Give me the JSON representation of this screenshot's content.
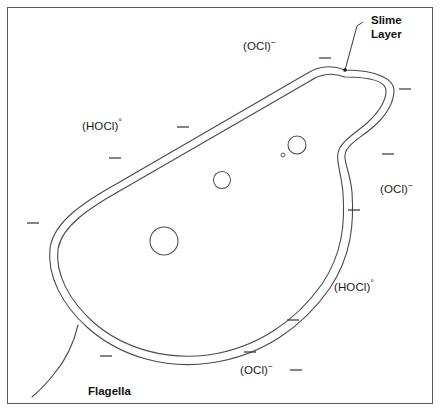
{
  "figure": {
    "background_color": "#ffffff",
    "frame_color": "#5a5a5a",
    "line_color": "#4a4a4a",
    "text_color": "#1a1a1a"
  },
  "callouts": [
    {
      "name": "slime-layer",
      "line1": "Slime",
      "line2": "Layer",
      "x": 371,
      "y": 14,
      "leader": {
        "from_x": 363,
        "from_y": 22,
        "elbow_x": 357,
        "elbow_y": 26,
        "to_x": 345,
        "to_y": 70
      }
    }
  ],
  "parts": [
    {
      "name": "flagella",
      "label": "Flagella",
      "x": 88,
      "y": 385
    }
  ],
  "species": [
    {
      "name": "ocl-top",
      "formula": "(OCl)",
      "charge": "−",
      "x": 243,
      "y": 40
    },
    {
      "name": "hocl-left",
      "formula": "(HOCl)",
      "charge": "°",
      "x": 82,
      "y": 120
    },
    {
      "name": "ocl-right",
      "formula": "(OCl)",
      "charge": "−",
      "x": 380,
      "y": 183
    },
    {
      "name": "hocl-right",
      "formula": "(HOCl)",
      "charge": "°",
      "x": 334,
      "y": 281
    },
    {
      "name": "ocl-bottom",
      "formula": "(OCl)",
      "charge": "−",
      "x": 240,
      "y": 364
    }
  ],
  "ion_dashes": [
    {
      "name": "ion-dash-1",
      "x": 325,
      "y": 58,
      "angle": 0
    },
    {
      "name": "ion-dash-2",
      "x": 405,
      "y": 89,
      "angle": 0
    },
    {
      "name": "ion-dash-3",
      "x": 183,
      "y": 127,
      "angle": 0
    },
    {
      "name": "ion-dash-4",
      "x": 115,
      "y": 158,
      "angle": 0
    },
    {
      "name": "ion-dash-5",
      "x": 388,
      "y": 154,
      "angle": 0
    },
    {
      "name": "ion-dash-6",
      "x": 33,
      "y": 223,
      "angle": 0
    },
    {
      "name": "ion-dash-7",
      "x": 354,
      "y": 210,
      "angle": 0
    },
    {
      "name": "ion-dash-8",
      "x": 293,
      "y": 320,
      "angle": 0
    },
    {
      "name": "ion-dash-9",
      "x": 106,
      "y": 356,
      "angle": 0
    },
    {
      "name": "ion-dash-10",
      "x": 250,
      "y": 352,
      "angle": 0
    },
    {
      "name": "ion-dash-11",
      "x": 296,
      "y": 370,
      "angle": 0
    }
  ],
  "inclusions": [
    {
      "name": "inclusion-large",
      "cx": 164,
      "cy": 241,
      "r": 14
    },
    {
      "name": "inclusion-medium",
      "cx": 222,
      "cy": 180,
      "r": 8.5
    },
    {
      "name": "inclusion-small",
      "cx": 297,
      "cy": 145,
      "r": 9
    },
    {
      "name": "inclusion-dot",
      "cx": 283,
      "cy": 155,
      "r": 2
    }
  ],
  "cell": {
    "outer_path": "M 345 70 C 330 64 318 66 306 74 L 118 183 C 82 203 54 222 50 248 C 47 276 62 305 88 328 C 122 358 168 369 210 363 C 262 356 303 327 330 288 C 352 255 354 222 352 192 C 350 172 344 163 345 155 C 346 145 360 138 372 128 C 386 116 394 103 394 90 C 394 80 378 70 345 70 Z",
    "inner_path": "M 345 77 C 331 72 320 74 310 81 L 123 189 C 89 208 62 226 58 249 C 55 274 69 300 93 322 C 125 350 168 360 208 355 C 257 348 296 321 322 284 C 343 253 345 222 343 193 C 341 171 336 162 338 153 C 340 142 354 134 366 124 C 378 113 386 102 386 91 C 386 82 374 77 345 77 Z",
    "flagellum_path": "M 78 325 C 74 342 66 360 54 374 C 46 384 38 392 32 397"
  }
}
